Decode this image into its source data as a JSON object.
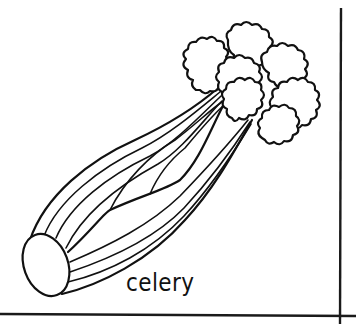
{
  "illustration": {
    "subject": "celery",
    "style": "black line art on white",
    "label": "celery",
    "colors": {
      "ink": "#111111",
      "background": "#ffffff"
    },
    "border": {
      "right_vertical_line": true,
      "bottom_horizontal_line": true
    }
  }
}
